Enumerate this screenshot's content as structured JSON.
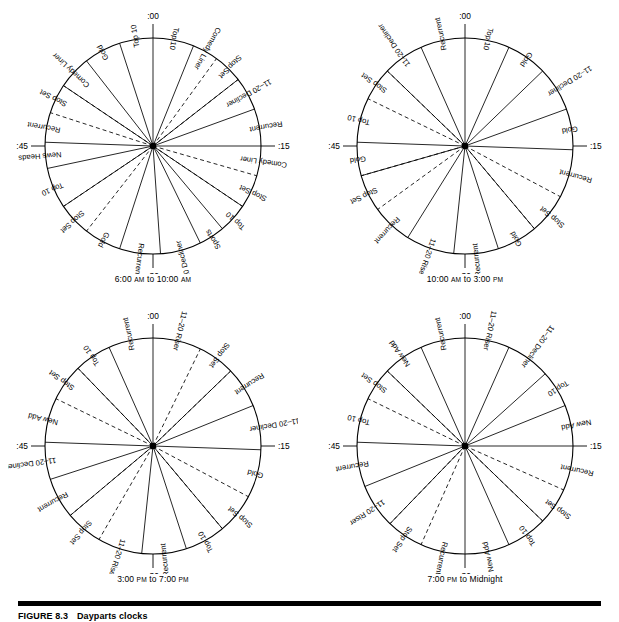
{
  "figure": {
    "number": "FIGURE 8.3",
    "title": "Dayparts clocks"
  },
  "hour_markers": {
    "top": ":00",
    "right": ":15",
    "bottom": ":30",
    "left": ":45"
  },
  "clocks": [
    {
      "id": "clock-morning",
      "caption_prefix": "6:00 ",
      "caption_sc1": "AM",
      "caption_mid": " to 10:00 ",
      "caption_sc2": "AM",
      "caption_full": "6:00 AM to 10:00 AM",
      "segments": [
        {
          "label": "Top 10",
          "start": 0,
          "end": 22,
          "dashed": false
        },
        {
          "label": "Comedy Liner",
          "start": 22,
          "end": 36,
          "dashed": false
        },
        {
          "label": "Stop Set",
          "start": 36,
          "end": 52,
          "dashed": true
        },
        {
          "label": "11-20 Decliner",
          "start": 52,
          "end": 70,
          "dashed": false
        },
        {
          "label": "Recurrent",
          "start": 70,
          "end": 90,
          "dashed": false
        },
        {
          "label": "Comedy Liner",
          "start": 90,
          "end": 106,
          "dashed": false
        },
        {
          "label": "Stop Set",
          "start": 106,
          "end": 124,
          "dashed": true
        },
        {
          "label": "Top 10",
          "start": 124,
          "end": 140,
          "dashed": false
        },
        {
          "label": "Sports",
          "start": 140,
          "end": 154,
          "dashed": false
        },
        {
          "label": "11-20 Decliner",
          "start": 154,
          "end": 176,
          "dashed": false
        },
        {
          "label": "Recurrent",
          "start": 176,
          "end": 198,
          "dashed": false
        },
        {
          "label": "Gold",
          "start": 198,
          "end": 218,
          "dashed": false
        },
        {
          "label": "Stop Set",
          "start": 218,
          "end": 236,
          "dashed": true
        },
        {
          "label": "Top 10",
          "start": 236,
          "end": 258,
          "dashed": false
        },
        {
          "label": "News Heads",
          "start": 258,
          "end": 272,
          "dashed": false
        },
        {
          "label": "Recurrent",
          "start": 272,
          "end": 288,
          "dashed": false
        },
        {
          "label": "Stop Set",
          "start": 288,
          "end": 304,
          "dashed": true
        },
        {
          "label": "Comedy Liner",
          "start": 304,
          "end": 322,
          "dashed": false
        },
        {
          "label": "Gold",
          "start": 322,
          "end": 342,
          "dashed": false
        },
        {
          "label": "Top 10",
          "start": 342,
          "end": 360,
          "dashed": false
        }
      ]
    },
    {
      "id": "clock-midday",
      "caption_prefix": "10:00 ",
      "caption_sc1": "AM",
      "caption_mid": " to 3:00 ",
      "caption_sc2": "PM",
      "caption_full": "10:00 AM to 3:00 PM",
      "segments": [
        {
          "label": "Top 10",
          "start": 0,
          "end": 24,
          "dashed": false
        },
        {
          "label": "Gold",
          "start": 24,
          "end": 46,
          "dashed": false
        },
        {
          "label": "11-20 Decliner",
          "start": 46,
          "end": 70,
          "dashed": false
        },
        {
          "label": "Gold",
          "start": 70,
          "end": 92,
          "dashed": false
        },
        {
          "label": "Recurrent",
          "start": 92,
          "end": 118,
          "dashed": false
        },
        {
          "label": "Stop Set",
          "start": 118,
          "end": 140,
          "dashed": true
        },
        {
          "label": "Gold",
          "start": 140,
          "end": 162,
          "dashed": false
        },
        {
          "label": "Recurrent",
          "start": 162,
          "end": 186,
          "dashed": false
        },
        {
          "label": "11-20 Riser",
          "start": 186,
          "end": 212,
          "dashed": false
        },
        {
          "label": "Recurrent",
          "start": 212,
          "end": 234,
          "dashed": false
        },
        {
          "label": "Stop Set",
          "start": 234,
          "end": 254,
          "dashed": true
        },
        {
          "label": "Gold",
          "start": 254,
          "end": 272,
          "dashed": false
        },
        {
          "label": "Top 10",
          "start": 272,
          "end": 296,
          "dashed": false
        },
        {
          "label": "Stop Set",
          "start": 296,
          "end": 314,
          "dashed": true
        },
        {
          "label": "11-20 Decliner",
          "start": 314,
          "end": 336,
          "dashed": false
        },
        {
          "label": "Recurrent",
          "start": 336,
          "end": 360,
          "dashed": false
        }
      ]
    },
    {
      "id": "clock-afternoon",
      "caption_prefix": "3:00 ",
      "caption_sc1": "PM",
      "caption_mid": " to 7:00 ",
      "caption_sc2": "PM",
      "caption_full": "3:00 PM to 7:00 PM",
      "segments": [
        {
          "label": "11-20 Riser",
          "start": 0,
          "end": 26,
          "dashed": false
        },
        {
          "label": "Stop Set",
          "start": 26,
          "end": 46,
          "dashed": true
        },
        {
          "label": "Recurrent",
          "start": 46,
          "end": 68,
          "dashed": false
        },
        {
          "label": "11-20 Decliner",
          "start": 68,
          "end": 92,
          "dashed": false
        },
        {
          "label": "Gold",
          "start": 92,
          "end": 118,
          "dashed": false
        },
        {
          "label": "Stop Set",
          "start": 118,
          "end": 140,
          "dashed": true
        },
        {
          "label": "Top 10",
          "start": 140,
          "end": 162,
          "dashed": false
        },
        {
          "label": "Recurrent",
          "start": 162,
          "end": 186,
          "dashed": false
        },
        {
          "label": "11-20 Riser",
          "start": 186,
          "end": 210,
          "dashed": false
        },
        {
          "label": "Stop Set",
          "start": 210,
          "end": 230,
          "dashed": true
        },
        {
          "label": "Recurrent",
          "start": 230,
          "end": 252,
          "dashed": false
        },
        {
          "label": "11-20 Decliner",
          "start": 252,
          "end": 272,
          "dashed": false
        },
        {
          "label": "New Add",
          "start": 272,
          "end": 296,
          "dashed": false
        },
        {
          "label": "Stop Set",
          "start": 296,
          "end": 316,
          "dashed": true
        },
        {
          "label": "Top 10",
          "start": 316,
          "end": 336,
          "dashed": false
        },
        {
          "label": "Recurrent",
          "start": 336,
          "end": 360,
          "dashed": false
        }
      ]
    },
    {
      "id": "clock-evening",
      "caption_prefix": "7:00 ",
      "caption_sc1": "PM",
      "caption_mid": " to Midnight",
      "caption_sc2": "",
      "caption_full": "7:00 PM to Midnight",
      "segments": [
        {
          "label": "11-20 Riser",
          "start": 0,
          "end": 24,
          "dashed": false
        },
        {
          "label": "11-20 Decliner",
          "start": 24,
          "end": 48,
          "dashed": false
        },
        {
          "label": "Top 10",
          "start": 48,
          "end": 68,
          "dashed": false
        },
        {
          "label": "New Add",
          "start": 68,
          "end": 90,
          "dashed": false
        },
        {
          "label": "Recurrent",
          "start": 90,
          "end": 114,
          "dashed": false
        },
        {
          "label": "Stop Set",
          "start": 114,
          "end": 134,
          "dashed": true
        },
        {
          "label": "Top 10",
          "start": 134,
          "end": 156,
          "dashed": false
        },
        {
          "label": "New Add",
          "start": 156,
          "end": 180,
          "dashed": false
        },
        {
          "label": "Recurrent",
          "start": 180,
          "end": 204,
          "dashed": false
        },
        {
          "label": "Stop Set",
          "start": 204,
          "end": 224,
          "dashed": true
        },
        {
          "label": "11-20 Riser",
          "start": 224,
          "end": 248,
          "dashed": false
        },
        {
          "label": "Recurrent",
          "start": 248,
          "end": 272,
          "dashed": false
        },
        {
          "label": "Top 10",
          "start": 272,
          "end": 296,
          "dashed": false
        },
        {
          "label": "Stop Set",
          "start": 296,
          "end": 314,
          "dashed": true
        },
        {
          "label": "New Add",
          "start": 314,
          "end": 336,
          "dashed": false
        },
        {
          "label": "Recurrent",
          "start": 336,
          "end": 360,
          "dashed": false
        }
      ]
    }
  ],
  "colors": {
    "ink": "#000000",
    "background": "#ffffff"
  }
}
